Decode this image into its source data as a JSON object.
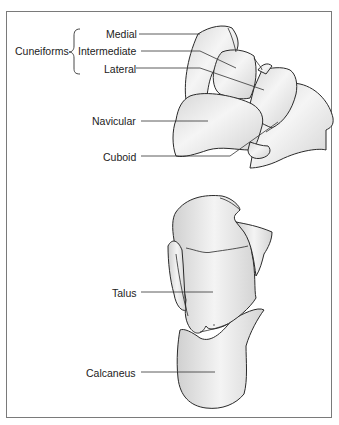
{
  "figure": {
    "group_label": "Cuneiforms",
    "labels": {
      "medial": "Medial",
      "intermediate": "Intermediate",
      "lateral": "Lateral",
      "navicular": "Navicular",
      "cuboid": "Cuboid",
      "talus": "Talus",
      "calcaneus": "Calcaneus"
    },
    "colors": {
      "bone_fill": "#e4e4e4",
      "bone_highlight": "#f6f6f6",
      "outline": "#2a2a2a",
      "leader": "#333333",
      "frame": "#7a7a7a"
    }
  }
}
